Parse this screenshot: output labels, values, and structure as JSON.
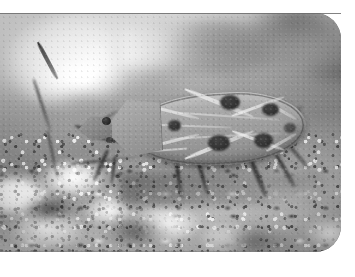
{
  "document": {
    "type": "photograph-figure",
    "media": "grayscale macro photograph",
    "alt_text": "Close-up grayscale photograph of a spotted shield-shaped true bug (Hemiptera) resting on crusty pale soil with plant debris",
    "caption": ""
  },
  "figure": {
    "frame": {
      "corner_style": "rounded-right",
      "corner_radius_px": 26,
      "background_color": "#ffffff",
      "border_color": "#6c6c6c"
    },
    "photo": {
      "left_px": 0,
      "top_px": 13,
      "width_px": 341,
      "height_px": 239,
      "color_mode": "grayscale",
      "focus": "shallow depth of field, blurred background"
    }
  },
  "subject": {
    "name": "true-bug",
    "common_label": "seed bug",
    "order": "Hemiptera",
    "orientation": "head to the left, body angled slightly upward",
    "parts": [
      {
        "name": "head",
        "label": "head"
      },
      {
        "name": "eye",
        "label": "compound eye"
      },
      {
        "name": "pronotum",
        "label": "pronotum"
      },
      {
        "name": "hemelytra",
        "label": "forewings"
      },
      {
        "name": "antenna",
        "label": "antenna"
      },
      {
        "name": "leg",
        "label": "leg"
      }
    ],
    "markings": {
      "pattern": "pale X-shaped veins with dark round spots",
      "spot_count": 7,
      "spot_color": "#3a3834",
      "body_color": "#a9a59b"
    }
  },
  "background": {
    "substrate": "crusty pale soil and lichen",
    "elements": [
      {
        "name": "grass-stem",
        "label": "thin grass stem"
      },
      {
        "name": "soil-crust",
        "label": "white crusty soil"
      },
      {
        "name": "plant-debris",
        "label": "plant debris"
      }
    ],
    "tones": {
      "highlight": "#ffffff",
      "midtone": "#9d9d9d",
      "shadow": "#2d2d2a"
    }
  }
}
